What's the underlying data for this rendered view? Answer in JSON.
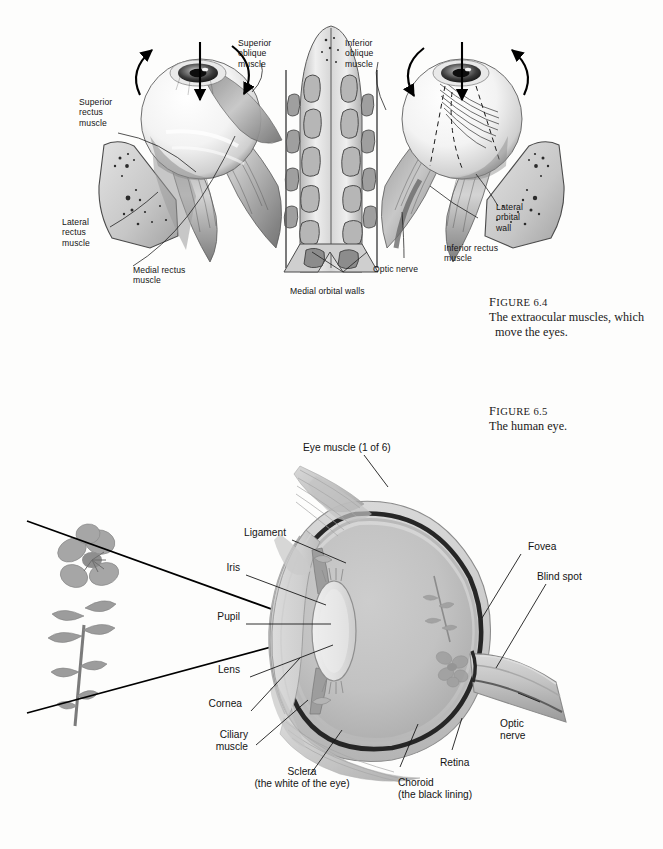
{
  "page": {
    "background": "#fdfdfc",
    "width": 663,
    "height": 849
  },
  "figures": [
    {
      "id": "figure-6-4",
      "number": "6.4",
      "caption_head_small": "IGURE",
      "caption_head_initial": "F",
      "caption_head": "FIGURE 6.4",
      "caption_line1": "The extraocular muscles, which",
      "caption_line2": "move the eyes.",
      "illustration_name": "extraocular-muscles-illustration",
      "labels": [
        {
          "name": "label-superior-rectus-muscle",
          "text": "Superior\nrectus\nmuscle"
        },
        {
          "name": "label-superior-oblique-muscle",
          "text": "Superior\noblique\nmuscle"
        },
        {
          "name": "label-inferior-oblique-muscle",
          "text": "Inferior\noblique\nmuscle"
        },
        {
          "name": "label-lateral-rectus-muscle",
          "text": "Lateral\nrectus\nmuscle"
        },
        {
          "name": "label-medial-rectus-muscle",
          "text": "Medial rectus\nmuscle"
        },
        {
          "name": "label-medial-orbital-walls",
          "text": "Medial orbital walls"
        },
        {
          "name": "label-optic-nerve",
          "text": "Optic nerve"
        },
        {
          "name": "label-inferior-rectus-muscle",
          "text": "Inferior rectus\nmuscle"
        },
        {
          "name": "label-lateral-orbital-wall",
          "text": "Lateral\norbital\nwall"
        }
      ]
    },
    {
      "id": "figure-6-5",
      "number": "6.5",
      "caption_head": "FIGURE 6.5",
      "caption_line1": "The human eye.",
      "illustration_name": "human-eye-cross-section-illustration",
      "labels": [
        {
          "name": "label-eye-muscle",
          "text": "Eye muscle (1 of 6)"
        },
        {
          "name": "label-ligament",
          "text": "Ligament"
        },
        {
          "name": "label-iris",
          "text": "Iris"
        },
        {
          "name": "label-pupil",
          "text": "Pupil"
        },
        {
          "name": "label-lens",
          "text": "Lens"
        },
        {
          "name": "label-cornea",
          "text": "Cornea"
        },
        {
          "name": "label-ciliary-muscle",
          "text": "Ciliary\nmuscle"
        },
        {
          "name": "label-sclera",
          "text": "Sclera\n(the white of the eye)"
        },
        {
          "name": "label-choroid",
          "text": "Choroid\n(the black lining)"
        },
        {
          "name": "label-retina",
          "text": "Retina"
        },
        {
          "name": "label-fovea",
          "text": "Fovea"
        },
        {
          "name": "label-blind-spot",
          "text": "Blind spot"
        },
        {
          "name": "label-optic-nerve",
          "text": "Optic\nnerve"
        }
      ],
      "object_name": "flower-stimulus"
    }
  ],
  "colors": {
    "ink": "#141414",
    "ray": "#000000",
    "sclera_fill": "#c9c9c9",
    "vitreous_fill": "#bcbcbc",
    "choroid_dark": "#2a2a2a",
    "muscle_gray": "#b0b0b0",
    "bone_gray": "#cfcfcf"
  }
}
